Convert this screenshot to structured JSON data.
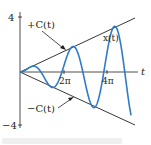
{
  "chart_data": {
    "type": "line",
    "title": "",
    "xlabel": "t",
    "ylabel": "",
    "ylim": [
      -4,
      4
    ],
    "xlim": [
      0,
      5.4
    ],
    "x_units": "pi",
    "x_ticks": [
      {
        "value": 2,
        "label": "2π"
      },
      {
        "value": 4,
        "label": "4π"
      }
    ],
    "y_ticks": [
      {
        "value": 4,
        "label": "4"
      },
      {
        "value": -4,
        "label": "−4"
      }
    ],
    "series": [
      {
        "name": "+C(t)",
        "kind": "line",
        "color": "#231f20",
        "formula": "C(t) = 0.75·t/π",
        "points": [
          [
            0,
            0
          ],
          [
            5.3,
            3.98
          ]
        ]
      },
      {
        "name": "−C(t)",
        "kind": "line",
        "color": "#231f20",
        "formula": "-C(t)",
        "points": [
          [
            0,
            0
          ],
          [
            5.3,
            -3.98
          ]
        ]
      },
      {
        "name": "x(t)",
        "kind": "oscillation",
        "color": "#2e7bc6",
        "formula": "x(t) = C(t)·sin(t)",
        "t_end_pi": 5.3
      }
    ],
    "annotations": [
      {
        "text": "+C(t)",
        "points_to": "+C(t)"
      },
      {
        "text": "x(t)",
        "points_to": "x(t)"
      },
      {
        "text": "−C(t)",
        "points_to": "−C(t)"
      }
    ],
    "grid": false,
    "legend": "none"
  },
  "labels": {
    "y_top": "4",
    "y_bottom": "−4",
    "x_axis": "t",
    "tick_2pi": "2π",
    "tick_4pi": "4π",
    "plus_c": "+C(t)",
    "minus_c": "−C(t)",
    "x_of_t": "x(t)"
  }
}
